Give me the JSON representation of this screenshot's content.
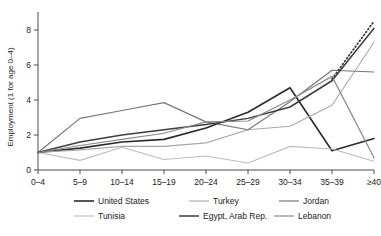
{
  "chart_data": {
    "type": "line",
    "title": "",
    "xlabel": "",
    "ylabel": "Employment (1 for age 0–4)",
    "categories": [
      "0–4",
      "5–9",
      "10–14",
      "15–19",
      "20–24",
      "25–29",
      "30–34",
      "35–39",
      "≥40"
    ],
    "ylim": [
      0,
      8.8
    ],
    "yticks": [
      0,
      2,
      4,
      6,
      8
    ],
    "ytick_labels": [
      "0",
      "2",
      "4",
      "6",
      "8"
    ],
    "grid": false,
    "legend_position": "bottom",
    "series": [
      {
        "name": "United States",
        "color": "#2b2b2b",
        "width": 1.6,
        "dash": "none",
        "values": [
          1.0,
          1.25,
          1.6,
          1.75,
          2.4,
          3.3,
          4.7,
          1.1,
          1.8
        ]
      },
      {
        "name": "Turkey",
        "color": "#a8a8a8",
        "width": 1.1,
        "dash": "none",
        "values": [
          1.0,
          1.15,
          1.35,
          1.35,
          1.55,
          2.3,
          2.5,
          3.7,
          7.3
        ]
      },
      {
        "name": "Jordan",
        "color": "#777777",
        "width": 1.2,
        "dash": "none",
        "values": [
          1.0,
          2.95,
          3.4,
          3.85,
          2.75,
          2.3,
          3.9,
          5.7,
          5.6
        ]
      },
      {
        "name": "Tunisia",
        "color": "#bdbdbd",
        "width": 1.1,
        "dash": "none",
        "values": [
          1.0,
          0.55,
          1.3,
          0.6,
          0.8,
          0.4,
          1.35,
          1.2,
          0.5
        ]
      },
      {
        "name": "Egypt, Arab Rep.",
        "color": "#3d3d3d",
        "width": 1.5,
        "dash": "none",
        "values": [
          1.0,
          1.6,
          2.0,
          2.3,
          2.6,
          2.95,
          3.6,
          5.1,
          8.1
        ]
      },
      {
        "name": "Lebanon",
        "color": "#8a8a8a",
        "width": 1.2,
        "dash": "none",
        "values": [
          1.0,
          1.4,
          1.75,
          2.1,
          2.75,
          2.8,
          4.0,
          5.35,
          0.7
        ]
      },
      {
        "name": "",
        "color": "#3d3d3d",
        "width": 1.8,
        "dash": "1,2.6",
        "values": [
          null,
          null,
          null,
          null,
          null,
          null,
          null,
          5.2,
          8.5
        ],
        "hide_from_legend": true
      }
    ],
    "legend": [
      {
        "label": "United States",
        "color": "#2b2b2b",
        "width": 1.6
      },
      {
        "label": "Turkey",
        "color": "#a8a8a8",
        "width": 1.1
      },
      {
        "label": "Jordan",
        "color": "#777777",
        "width": 1.2
      },
      {
        "label": "Tunisia",
        "color": "#bdbdbd",
        "width": 1.1
      },
      {
        "label": "Egypt, Arab Rep.",
        "color": "#3d3d3d",
        "width": 1.5
      },
      {
        "label": "Lebanon",
        "color": "#8a8a8a",
        "width": 1.2
      }
    ]
  }
}
